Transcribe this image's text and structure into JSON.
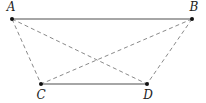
{
  "diagram": {
    "title": "",
    "points": [
      {
        "id": "A",
        "label": "A",
        "x": 12,
        "y": 19,
        "lx": 11,
        "ly": 11
      },
      {
        "id": "B",
        "label": "B",
        "x": 192,
        "y": 19,
        "lx": 194,
        "ly": 11
      },
      {
        "id": "C",
        "label": "C",
        "x": 41,
        "y": 84,
        "lx": 41,
        "ly": 99
      },
      {
        "id": "D",
        "label": "D",
        "x": 147,
        "y": 84,
        "lx": 148,
        "ly": 99
      }
    ],
    "segments": [
      {
        "from": "A",
        "to": "B",
        "style": "solid"
      },
      {
        "from": "C",
        "to": "D",
        "style": "solid"
      },
      {
        "from": "A",
        "to": "C",
        "style": "dashed"
      },
      {
        "from": "A",
        "to": "D",
        "style": "dashed"
      },
      {
        "from": "B",
        "to": "C",
        "style": "dashed"
      },
      {
        "from": "B",
        "to": "D",
        "style": "dashed"
      }
    ],
    "colors": {
      "solid": "#888888",
      "dashed": "#8a8a8a",
      "point": "#111111",
      "label": "#222222"
    }
  }
}
